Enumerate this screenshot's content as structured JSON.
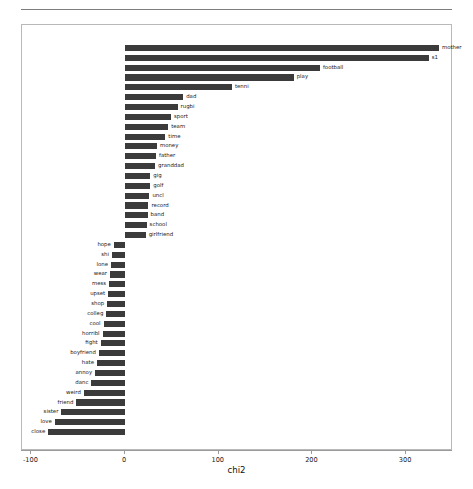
{
  "chart_data": {
    "type": "bar",
    "orientation": "horizontal",
    "title": "",
    "xlabel": "chi2",
    "ylabel": "",
    "xlim": [
      -110,
      350
    ],
    "xticks": [
      -100,
      0,
      100,
      200,
      300
    ],
    "xticklabels": [
      "-100",
      "0",
      "100",
      "200",
      "300"
    ],
    "grid": false,
    "legend": null,
    "bar_color": "#3b3b3b",
    "note": "Diverging horizontal bar chart of chi2 term scores; positive bars labelled to the right of the bar end, negative bars labelled to the left of the bar start.",
    "categories": [
      "mother",
      "s1",
      "football",
      "play",
      "tenni",
      "dad",
      "rugbi",
      "sport",
      "team",
      "time",
      "money",
      "father",
      "granddad",
      "gig",
      "golf",
      "uncl",
      "record",
      "band",
      "school",
      "girlfriend",
      "hope",
      "shi",
      "lone",
      "wear",
      "mess",
      "upset",
      "shop",
      "colleg",
      "cool",
      "horribl",
      "fight",
      "boyfriend",
      "hate",
      "annoy",
      "danc",
      "weird",
      "friend",
      "sister",
      "love",
      "close"
    ],
    "values": [
      335,
      324,
      208,
      180,
      114,
      62,
      56,
      49,
      46,
      43,
      34,
      33,
      32,
      27,
      27,
      26,
      25,
      24,
      23,
      22,
      -12,
      -14,
      -15,
      -16,
      -17,
      -18,
      -19,
      -20,
      -23,
      -24,
      -26,
      -28,
      -30,
      -32,
      -36,
      -44,
      -52,
      -68,
      -75,
      -82
    ]
  },
  "axis": {
    "x_title": "chi2"
  }
}
